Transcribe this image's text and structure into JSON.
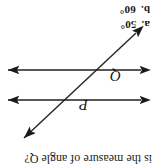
{
  "page": {
    "orientation_degrees": 180,
    "background_color": "#ffffff",
    "ink_color": "#1a1a1a"
  },
  "question": {
    "stem_text": "is the measure of angle Q?",
    "subject_label": "angle Q"
  },
  "choices": [
    {
      "letter": "a.",
      "value": "50°"
    },
    {
      "letter": "b.",
      "value": "60°"
    }
  ],
  "diagram": {
    "type": "parallel-lines-with-transversal",
    "labels": {
      "upper_angle": "P",
      "lower_angle": "Q"
    },
    "lines": [
      {
        "name": "upper-parallel-line",
        "orientation": "horizontal",
        "arrowheads": "both-ends"
      },
      {
        "name": "lower-parallel-line",
        "orientation": "horizontal",
        "arrowheads": "both-ends"
      },
      {
        "name": "transversal-line",
        "orientation": "diagonal-lower-left-to-upper-right",
        "arrowheads": "both-ends"
      }
    ]
  }
}
